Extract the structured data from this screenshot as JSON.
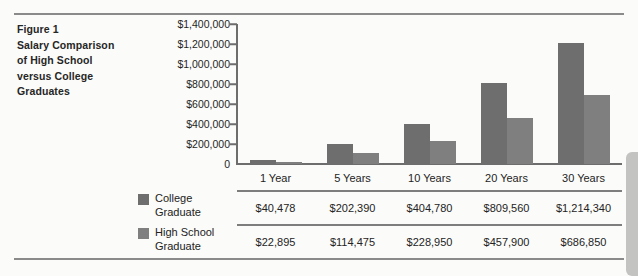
{
  "figure": {
    "caption": "Figure 1 Salary Comparison of High School versus College Graduates",
    "caption_lines": [
      "Figure 1",
      "Salary Comparison",
      "of High School",
      "versus College",
      "Graduates"
    ]
  },
  "legend": {
    "items": [
      {
        "label": "College Graduate",
        "line1": "College",
        "line2": "Graduate",
        "color": "#6e6e6e"
      },
      {
        "label": "High School Graduate",
        "line1": "High School",
        "line2": "Graduate",
        "color": "#7f7f7f"
      }
    ]
  },
  "table": {
    "headers": [
      "1 Year",
      "5 Years",
      "10 Years",
      "20 Years",
      "30 Years"
    ],
    "rows": [
      {
        "series": "College Graduate",
        "values": [
          "$40,478",
          "$202,390",
          "$404,780",
          "$809,560",
          "$1,214,340"
        ]
      },
      {
        "series": "High School Graduate",
        "values": [
          "$22,895",
          "$114,475",
          "$228,950",
          "$457,900",
          "$686,850"
        ]
      }
    ]
  },
  "chart_data": {
    "type": "bar",
    "xlabel": "",
    "ylabel": "",
    "categories": [
      "1 Year",
      "5 Years",
      "10 Years",
      "20 Years",
      "30 Years"
    ],
    "series": [
      {
        "name": "College Graduate",
        "color": "#6e6e6e",
        "values": [
          40478,
          202390,
          404780,
          809560,
          1214340
        ]
      },
      {
        "name": "High School Graduate",
        "color": "#7f7f7f",
        "values": [
          22895,
          114475,
          228950,
          457900,
          686850
        ]
      }
    ],
    "ylim": [
      0,
      1400000
    ],
    "ytick_values": [
      1400000,
      1200000,
      1000000,
      800000,
      600000,
      400000,
      200000,
      0
    ],
    "ytick_labels": [
      "$1,400,000",
      "$1,200,000",
      "$1,000,000",
      "$800,000",
      "$600,000",
      "$400,000",
      "$200,000",
      "0"
    ],
    "grid": false,
    "legend_position": "left-below"
  }
}
